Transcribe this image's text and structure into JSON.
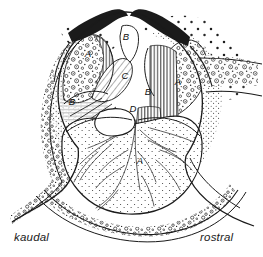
{
  "figure": {
    "orientation_labels": {
      "left": "kaudal",
      "right": "rostral"
    },
    "background_color": "#ffffff",
    "ink_color": "#1a1a1a"
  },
  "labels": [
    {
      "id": "label-a-left",
      "text": "A",
      "x": 88,
      "y": 57,
      "region": "left upper lobe"
    },
    {
      "id": "label-b-apex",
      "text": "B",
      "x": 126,
      "y": 40,
      "region": "top central notch"
    },
    {
      "id": "label-a-right",
      "text": "A",
      "x": 178,
      "y": 85,
      "region": "right upper lobe"
    },
    {
      "id": "label-c",
      "text": "C",
      "x": 125,
      "y": 79,
      "region": "central hatched wedge"
    },
    {
      "id": "label-b-center",
      "text": "B",
      "x": 148,
      "y": 95,
      "region": "central right column"
    },
    {
      "id": "label-b-left",
      "text": "B",
      "x": 72,
      "y": 105,
      "region": "left mid fibre fan"
    },
    {
      "id": "label-d",
      "text": "D",
      "x": 133,
      "y": 112,
      "region": "central oval lumen"
    },
    {
      "id": "label-a-bulb",
      "text": "A",
      "x": 140,
      "y": 164,
      "region": "lower bulb"
    }
  ],
  "legend_note": "Italic capital letters A, B, C, D mark tissue zones; kaudal and rostral mark the section axis."
}
